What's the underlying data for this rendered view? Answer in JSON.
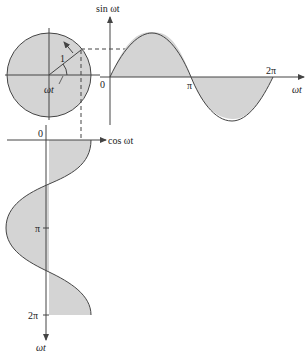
{
  "figure": {
    "circle_radius_label": "1",
    "angle_label": "ωt",
    "sine_axis": {
      "y_label": "sin ωt",
      "x_label": "ωt",
      "origin": "0",
      "ticks": [
        "π",
        "2π"
      ]
    },
    "cosine_axis": {
      "x_label": "cos ωt",
      "y_label": "ωt",
      "origin": "0",
      "ticks": [
        "π",
        "2π"
      ]
    },
    "colors": {
      "fill": "#d4d4d4",
      "line": "#444444"
    }
  }
}
